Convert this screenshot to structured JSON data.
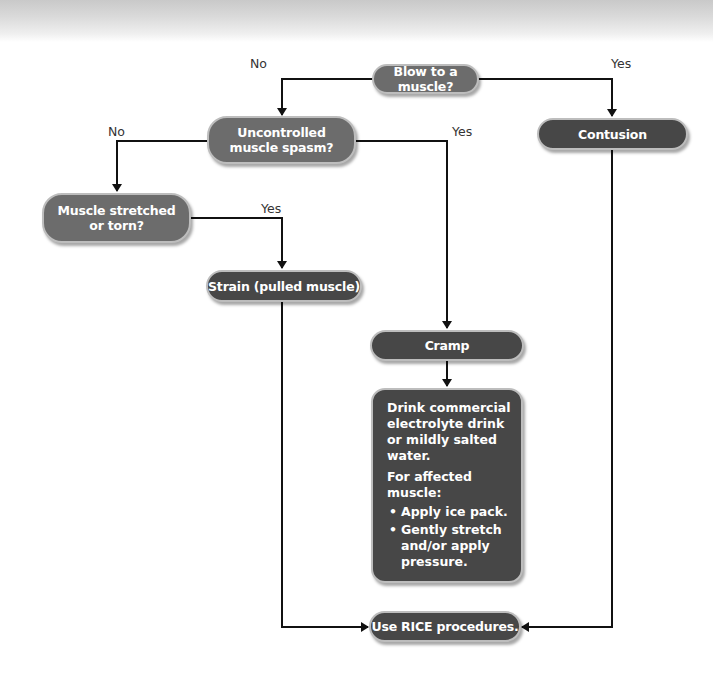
{
  "diagram": {
    "type": "flowchart",
    "colors": {
      "question_node": "#6c6c6c",
      "outcome_node": "#474747",
      "node_border": "#bdbdbd",
      "connector": "#111111",
      "label_text": "#333333"
    },
    "nodes": {
      "blow": {
        "label": "Blow to a muscle?",
        "kind": "question"
      },
      "spasm": {
        "label_line1": "Uncontrolled",
        "label_line2": "muscle spasm?",
        "kind": "question"
      },
      "stretched": {
        "label_line1": "Muscle stretched",
        "label_line2": "or torn?",
        "kind": "question"
      },
      "contusion": {
        "label": "Contusion",
        "kind": "outcome"
      },
      "strain": {
        "label": "Strain (pulled muscle)",
        "kind": "outcome"
      },
      "cramp": {
        "label": "Cramp",
        "kind": "outcome"
      },
      "cramp_treatment": {
        "para1": "Drink commercial electrolyte drink or mildly salted water.",
        "para2": "For affected muscle:",
        "bullets": [
          "Apply ice pack.",
          "Gently stretch and/or apply pressure."
        ],
        "bullet_glyph": "•"
      },
      "rice": {
        "label": "Use RICE procedures.",
        "kind": "outcome"
      }
    },
    "edge_labels": {
      "blow_no": "No",
      "blow_yes": "Yes",
      "spasm_no": "No",
      "spasm_yes": "Yes",
      "stretched_yes": "Yes"
    },
    "edges": [
      {
        "from": "blow",
        "to": "spasm",
        "label": "No"
      },
      {
        "from": "blow",
        "to": "contusion",
        "label": "Yes"
      },
      {
        "from": "spasm",
        "to": "stretched",
        "label": "No"
      },
      {
        "from": "spasm",
        "to": "cramp",
        "label": "Yes"
      },
      {
        "from": "stretched",
        "to": "strain",
        "label": "Yes"
      },
      {
        "from": "cramp",
        "to": "cramp_treatment",
        "label": ""
      },
      {
        "from": "strain",
        "to": "rice",
        "label": ""
      },
      {
        "from": "contusion",
        "to": "rice",
        "label": ""
      }
    ]
  }
}
